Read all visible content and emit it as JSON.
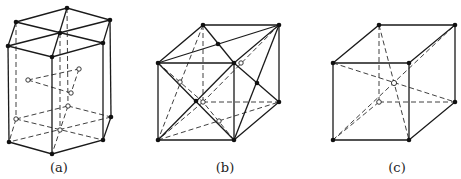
{
  "figure": {
    "panels": [
      {
        "id": "a",
        "label": "(a)",
        "structure": "hexagonal close-packed unit cell"
      },
      {
        "id": "b",
        "label": "(b)",
        "structure": "face-centered cubic unit cell"
      },
      {
        "id": "c",
        "label": "(c)",
        "structure": "body-centered cubic unit cell"
      }
    ]
  },
  "colors": {
    "line": "#1a1a1a",
    "atom": "#111111",
    "background": "#ffffff"
  }
}
